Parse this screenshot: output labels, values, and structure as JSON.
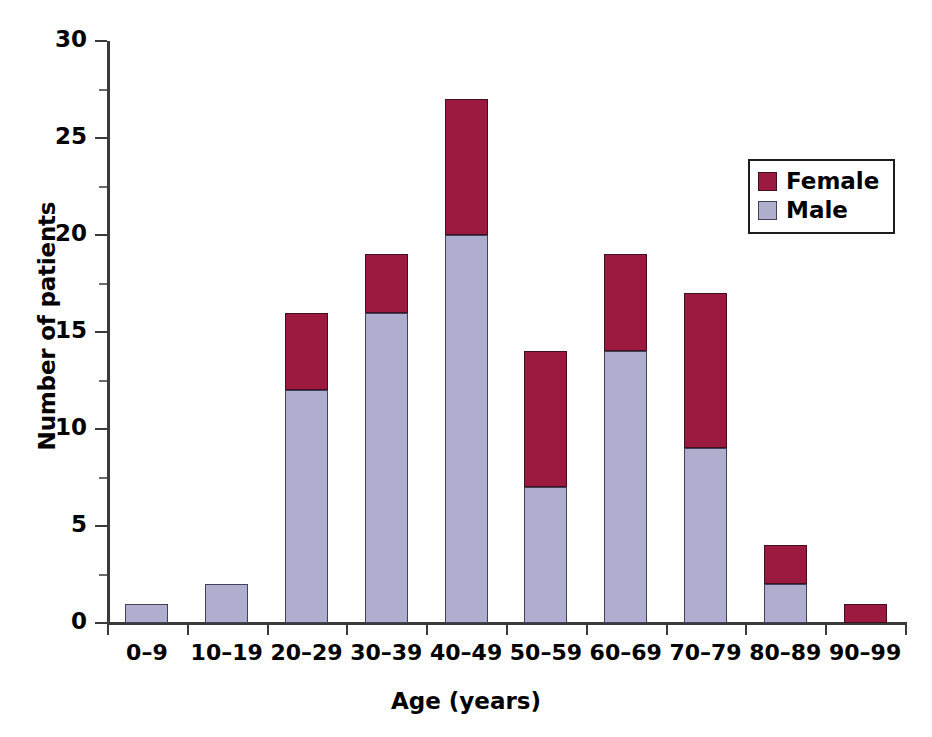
{
  "chart_data": {
    "type": "bar",
    "subtype": "stacked",
    "title": "",
    "xlabel": "Age (years)",
    "ylabel": "Number of patients",
    "categories": [
      "0–9",
      "10–19",
      "20–29",
      "30–39",
      "40–49",
      "50–59",
      "60–69",
      "70–79",
      "80–89",
      "90–99"
    ],
    "series": [
      {
        "name": "Male",
        "color": "#b0aece",
        "values": [
          1,
          2,
          12,
          16,
          20,
          7,
          14,
          9,
          2,
          0
        ]
      },
      {
        "name": "Female",
        "color": "#9c1a3f",
        "values": [
          0,
          0,
          4,
          3,
          7,
          7,
          5,
          8,
          2,
          1
        ]
      }
    ],
    "totals": [
      1,
      2,
      16,
      19,
      27,
      14,
      19,
      17,
      4,
      1
    ],
    "ylim": [
      0,
      30
    ],
    "y_major_ticks": [
      0,
      5,
      10,
      15,
      20,
      25,
      30
    ],
    "y_minor_ticks": [
      2.5,
      7.5,
      12.5,
      17.5,
      22.5,
      27.5
    ],
    "y_tick_labels": [
      "0",
      "5",
      "10",
      "15",
      "20",
      "25",
      "30"
    ],
    "grid": false,
    "legend_position": "upper right",
    "legend_entries": [
      "Female",
      "Male"
    ]
  },
  "legend": {
    "female_label": "Female",
    "male_label": "Male"
  },
  "axes": {
    "x_title": "Age (years)",
    "y_title": "Number of patients"
  }
}
